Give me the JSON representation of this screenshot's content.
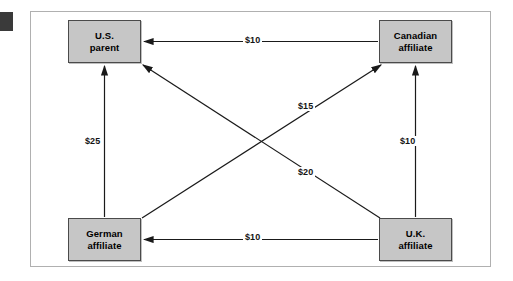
{
  "diagram": {
    "frame": {
      "border_color": "#b0b0b0",
      "background": "#ffffff"
    },
    "edge_mark": {
      "name": "page-edge-mark",
      "color": "#3a3a3a"
    },
    "node_style": {
      "fill": "#c6c6c6",
      "border": "#4a4a4a",
      "text_color": "#000000"
    },
    "arrow_color": "#1a1a1a",
    "nodes": [
      {
        "id": "us",
        "line1": "U.S.",
        "line2": "parent"
      },
      {
        "id": "canada",
        "line1": "Canadian",
        "line2": "affiliate"
      },
      {
        "id": "germany",
        "line1": "German",
        "line2": "affiliate"
      },
      {
        "id": "uk",
        "line1": "U.K.",
        "line2": "affiliate"
      }
    ],
    "edges": [
      {
        "id": "can-us",
        "from": "canada",
        "to": "us",
        "label": "$10",
        "orientation": "horizontal-top"
      },
      {
        "id": "uk-ger",
        "from": "uk",
        "to": "germany",
        "label": "$10",
        "orientation": "horizontal-bottom"
      },
      {
        "id": "ger-us",
        "from": "germany",
        "to": "us",
        "label": "$25",
        "orientation": "vertical-left"
      },
      {
        "id": "uk-can",
        "from": "uk",
        "to": "canada",
        "label": "$10",
        "orientation": "vertical-right"
      },
      {
        "id": "ger-can",
        "from": "germany",
        "to": "canada",
        "label": "$15",
        "orientation": "diagonal-up-right"
      },
      {
        "id": "uk-us",
        "from": "uk",
        "to": "us",
        "label": "$20",
        "orientation": "diagonal-up-left"
      }
    ]
  }
}
